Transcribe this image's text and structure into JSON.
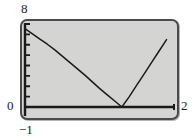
{
  "figure": {
    "background_color": "#ffffff",
    "panel_color": "#d4d4d2",
    "frame_color": "#4a4a4a",
    "curve_color": "#1a1a1a"
  },
  "labels": {
    "y_max": "8",
    "y_zero": "0",
    "x_min": "−1",
    "x_max": "2"
  },
  "chart_data": {
    "type": "line",
    "title": "",
    "xlabel": "",
    "ylabel": "",
    "xlim": [
      -1,
      2
    ],
    "ylim": [
      0,
      8
    ],
    "grid": false,
    "legend": null,
    "x_tick_labels": [
      "−1",
      "2"
    ],
    "y_tick_labels": [
      "0",
      "8"
    ],
    "y_minor_tick_count": 8,
    "axis_lines": {
      "x_axis_at_y": 0,
      "y_axis_at_x": -1
    },
    "annotations": [
      {
        "text": "vertex",
        "x": 0.95,
        "y": 0
      }
    ],
    "series": [
      {
        "name": "f(x)",
        "x": [
          -1.0,
          -0.85,
          -0.7,
          -0.55,
          -0.4,
          -0.25,
          -0.1,
          0.05,
          0.2,
          0.35,
          0.5,
          0.65,
          0.8,
          0.95,
          1.1,
          1.25,
          1.4,
          1.55,
          1.7,
          1.85
        ],
        "y": [
          7.55,
          7.05,
          6.55,
          6.05,
          5.5,
          4.9,
          4.3,
          3.7,
          3.1,
          2.45,
          1.8,
          1.2,
          0.6,
          0.0,
          1.0,
          2.1,
          3.2,
          4.3,
          5.4,
          6.5
        ]
      }
    ]
  }
}
